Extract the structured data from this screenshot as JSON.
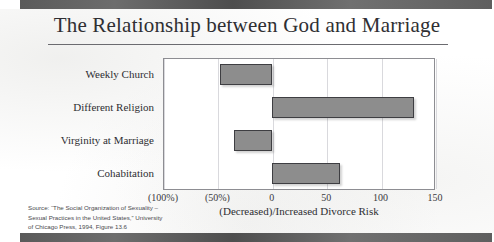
{
  "slide": {
    "title": "The Relationship between God and Marriage",
    "axis_title": "(Decreased)/Increased Divorce Risk",
    "source_lines": [
      "Source: “The Social Organization of Sexuality –",
      "Sexual Practices in the United States,” University",
      "of Chicago Press, 1994, Figure 13.6"
    ],
    "colors": {
      "bar_fill": "#8d8d8d",
      "bar_border": "#3e3e42",
      "frame": "#8d8d92",
      "gridline": "#d9d9dd",
      "text": "#2e2e32",
      "band": "#5a5a5a"
    }
  },
  "chart_data": {
    "type": "bar",
    "orientation": "horizontal",
    "title": "The Relationship between God and Marriage",
    "xlabel": "(Decreased)/Increased Divorce Risk",
    "ylabel": "",
    "categories": [
      "Weekly Church",
      "Different Religion",
      "Virginity at Marriage",
      "Cohabitation"
    ],
    "values": [
      -48,
      131,
      -35,
      63
    ],
    "xlim": [
      -100,
      150
    ],
    "xticks": [
      -100,
      -50,
      0,
      50,
      100,
      150
    ],
    "xticklabels": [
      "(100%)",
      "(50%)",
      "0",
      "50",
      "100",
      "150"
    ],
    "grid": true,
    "legend": "none"
  }
}
